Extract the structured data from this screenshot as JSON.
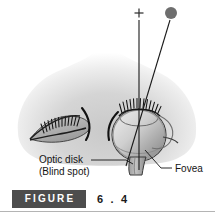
{
  "figure": {
    "tag_label": "FIGURE",
    "number": "6 . 4",
    "alt": "Top-down diagram of a human head showing both eyes, with the right eye drawn as a cross-section. Two sight lines converge on the eye: one from a plus sign and one from a filled dot."
  },
  "labels": {
    "optic_disk_line1": "Optic disk",
    "optic_disk_line2": "(Blind spot)",
    "fovea": "Fovea"
  },
  "stimuli": {
    "cross_mark": "+",
    "dot_mark": "●"
  },
  "colors": {
    "tag_background": "#4d4d4d",
    "tag_text": "#ffffff",
    "number_text": "#1a1a1a",
    "rule": "#b4b4b4",
    "page_background": "#ffffff",
    "label_text": "#141414",
    "ink": "#111111",
    "head_fill": "#d6d6d6",
    "eye_fill": "#b9b9b9",
    "dot_fill": "#6e6e6e"
  }
}
